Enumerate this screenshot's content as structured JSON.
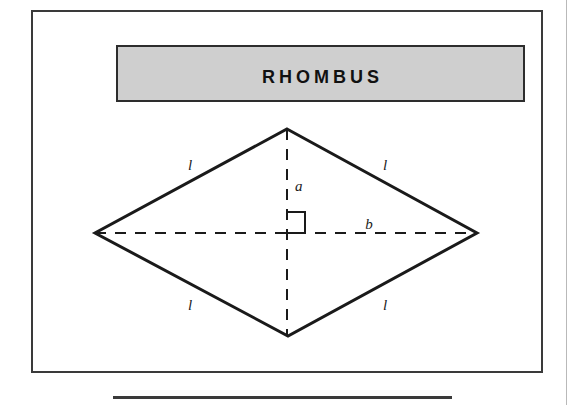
{
  "page": {
    "background_color": "#ffffff",
    "width": 572,
    "height": 405
  },
  "figure": {
    "frame": {
      "border_color": "#3a3a3a",
      "x": 31,
      "y": 10,
      "width": 512,
      "height": 363
    },
    "title_banner": {
      "text": "Rhombus",
      "background_color": "#cfcfcf",
      "border_color": "#2d2d2d",
      "text_color": "#111111"
    },
    "shape": {
      "name": "rhombus",
      "stroke_color": "#1a1a1a",
      "fill": "none",
      "vertices": {
        "top": {
          "x": 287,
          "y": 129
        },
        "right": {
          "x": 477,
          "y": 233
        },
        "bottom": {
          "x": 288,
          "y": 336
        },
        "left": {
          "x": 95,
          "y": 233
        }
      }
    },
    "diagonals": {
      "style": "dashed",
      "stroke_color": "#1a1a1a",
      "vertical": {
        "x": 287,
        "y1": 129,
        "y2": 336
      },
      "horizontal": {
        "y": 233,
        "x1": 95,
        "x2": 477
      }
    },
    "right_angle_marker": {
      "present": true,
      "description": "square marker at diagonal intersection"
    },
    "labels": [
      {
        "id": "side-top-left",
        "text": "l",
        "x": 190,
        "y": 170
      },
      {
        "id": "side-top-right",
        "text": "l",
        "x": 385,
        "y": 170
      },
      {
        "id": "side-bottom-left",
        "text": "l",
        "x": 190,
        "y": 310
      },
      {
        "id": "side-bottom-right",
        "text": "l",
        "x": 385,
        "y": 310
      },
      {
        "id": "altitude-a",
        "text": "a",
        "x": 297,
        "y": 190
      },
      {
        "id": "base-b",
        "text": "b",
        "x": 372,
        "y": 228
      }
    ]
  },
  "bottom_rule": {
    "color": "#3a3a3a",
    "x": 113,
    "y": 396,
    "width": 339
  }
}
